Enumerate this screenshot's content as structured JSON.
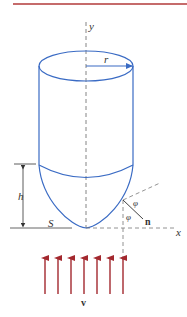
{
  "figure": {
    "labels": {
      "y_axis": "y",
      "x_axis": "x",
      "radius": "r",
      "height": "h",
      "surface": "S",
      "normal": "n",
      "angle1": "φ",
      "angle2": "φ",
      "velocity": "v"
    },
    "colors": {
      "body": "#3a6bc4",
      "arrows": "#a3282e",
      "top_rule": "#b23a3a",
      "axes": "#777777",
      "text": "#333333"
    },
    "flow_arrows_count": 7
  }
}
